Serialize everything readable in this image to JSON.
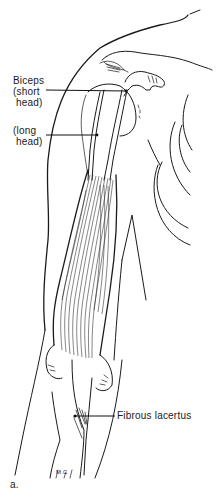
{
  "figure": {
    "panel_label": "a.",
    "signature": "M.C",
    "labels": {
      "biceps_line1": "Biceps",
      "biceps_line2": "(short",
      "biceps_line3": "head)",
      "long_line1": "(long",
      "long_line2": "head)",
      "fibrous": "Fibrous lacertus"
    },
    "colors": {
      "ink": "#1a1a1a",
      "background": "#ffffff"
    }
  }
}
